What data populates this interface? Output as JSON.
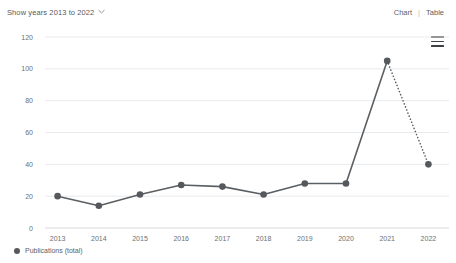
{
  "toolbar": {
    "years_selector_label": "Show years 2013 to 2022",
    "chevron_icon": "chevron-down-icon",
    "chart_view_label": "Chart",
    "separator_label": "|",
    "table_view_label": "Table",
    "menu_icon": "hamburger-menu-icon"
  },
  "legend": {
    "marker_icon": "circle-marker-icon",
    "label": "Publications (total)"
  },
  "colors": {
    "line": "#5a5f63",
    "marker": "#55585c",
    "grid": "#e9eaec",
    "axis": "#d6d8da",
    "text": "#6b7075"
  },
  "chart_data": {
    "type": "line",
    "title": "",
    "xlabel": "",
    "ylabel": "",
    "categories": [
      "2013",
      "2014",
      "2015",
      "2016",
      "2017",
      "2018",
      "2019",
      "2020",
      "2021",
      "2022"
    ],
    "series": [
      {
        "name": "Publications (total)",
        "values": [
          20,
          14,
          21,
          27,
          26,
          21,
          28,
          28,
          105,
          40
        ],
        "dotted_from_index": 8
      }
    ],
    "ylim": [
      0,
      120
    ],
    "yticks": [
      0,
      20,
      40,
      60,
      80,
      100,
      120
    ],
    "ytick_labels": [
      "0",
      "20",
      "40",
      "60",
      "80",
      "100",
      "120"
    ],
    "grid": true,
    "legend_position": "bottom-left"
  }
}
